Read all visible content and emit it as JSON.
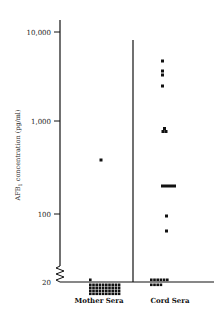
{
  "chart_data": {
    "type": "scatter",
    "subtype": "dot-plot",
    "title": "",
    "xlabel": "",
    "ylabel": "AFB1 concentration (pg/ml)",
    "yscale": "log",
    "y_axis_break": true,
    "y_axis_break_note": "Axis is broken between 20 and 100; the 20 baseline is not on the log scale and marks values at or below the detection floor.",
    "ylim": [
      20,
      10000
    ],
    "yticks": [
      20,
      100,
      1000,
      10000
    ],
    "ytick_labels": [
      "20",
      "100",
      "1,000",
      "10,000"
    ],
    "grid": false,
    "legend": null,
    "categories": [
      "Mother Sera",
      "Cord Sera"
    ],
    "value_precision_note": "Values estimated from pixel position on a log axis (~90px per decade); treat as approximate to roughly ±10%.",
    "baseline_count_note": "Baseline cluster counts are approximate estimates; individual dots in the dense clusters could not be resolved.",
    "series": [
      {
        "name": "Mother Sera",
        "points": [
          {
            "value": 390,
            "count": 1
          },
          {
            "value": 20,
            "count": 41,
            "note": "clustered at/below detection limit; count approximate"
          }
        ]
      },
      {
        "name": "Cord Sera",
        "points": [
          {
            "value": 4770,
            "count": 1
          },
          {
            "value": 3700,
            "count": 1
          },
          {
            "value": 3350,
            "count": 1
          },
          {
            "value": 2540,
            "count": 1
          },
          {
            "value": 830,
            "count": 3
          },
          {
            "value": 200,
            "count": 5
          },
          {
            "value": 93,
            "count": 1
          },
          {
            "value": 63,
            "count": 1
          },
          {
            "value": 20,
            "count": 10,
            "note": "clustered at/below detection limit; count approximate"
          }
        ]
      }
    ]
  },
  "axis": {
    "y_title": "AFB",
    "y_title_sub": "1",
    "y_title_rest": " concentration (pg/ml)",
    "ticks": [
      {
        "label": "10,000",
        "y": 32
      },
      {
        "label": "1,000",
        "y": 121
      },
      {
        "label": "100",
        "y": 214
      },
      {
        "label": "20",
        "y": 282
      }
    ]
  },
  "categories": {
    "mother": "Mother Sera",
    "cord": "Cord Sera"
  },
  "colors": {
    "ink": "#111111",
    "background": "#ffffff"
  }
}
